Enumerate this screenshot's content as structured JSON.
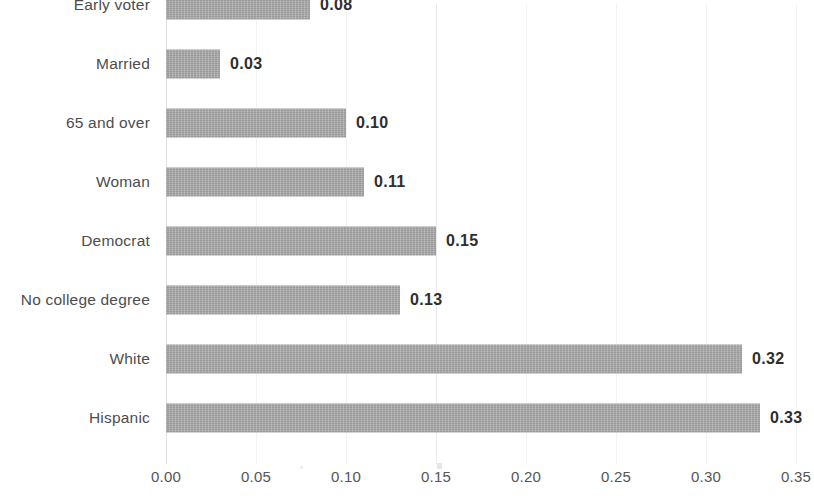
{
  "chart_data": {
    "type": "bar",
    "orientation": "horizontal",
    "title": "",
    "subtitle": "",
    "xlabel": "",
    "ylabel": "",
    "xlim": [
      0.0,
      0.35
    ],
    "xticks": [
      "0.00",
      "0.05",
      "0.10",
      "0.15",
      "0.20",
      "0.25",
      "0.30",
      "0.35"
    ],
    "xtick_values": [
      0.0,
      0.05,
      0.1,
      0.15,
      0.2,
      0.25,
      0.3,
      0.35
    ],
    "grid": true,
    "legend": false,
    "bar_color": "#a8a8a8",
    "label_color": "#4d4d4d",
    "value_color": "#2e2e2e",
    "categories": [
      "Early voter",
      "Married",
      "65 and over",
      "Woman",
      "Democrat",
      "No college degree",
      "White",
      "Hispanic"
    ],
    "values": [
      0.08,
      0.03,
      0.1,
      0.11,
      0.15,
      0.13,
      0.32,
      0.33
    ],
    "value_labels": [
      "0.08",
      "0.03",
      "0.10",
      "0.11",
      "0.15",
      "0.13",
      "0.32",
      "0.33"
    ]
  }
}
